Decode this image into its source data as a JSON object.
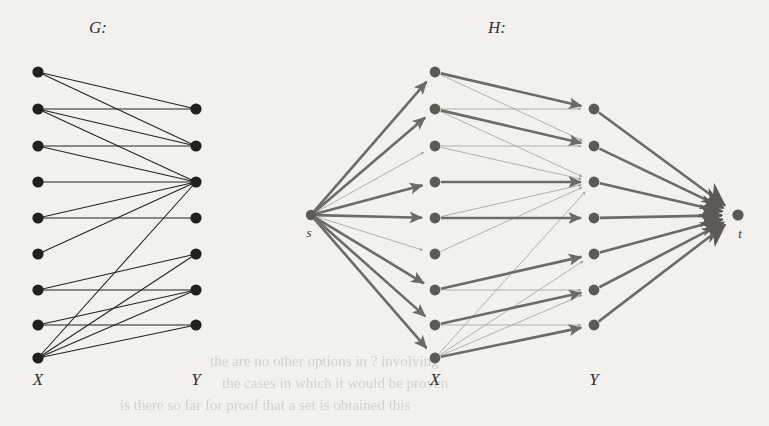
{
  "figure": {
    "background_color": "#f3f1ee",
    "ink_color": "#23211f",
    "flow_color": "#6e6b66",
    "thin_color": "#a7a39c",
    "titles": {
      "left": "G:",
      "right": "H:"
    },
    "column_labels": {
      "left_x": "X",
      "left_y": "Y",
      "right_x": "X",
      "right_y": "Y"
    },
    "terminal_labels": {
      "source": "s",
      "sink": "t"
    }
  },
  "graph_G": {
    "type": "bipartite-graph",
    "caption": "G:",
    "x_label": "X",
    "y_label": "Y",
    "x_nodes": [
      {
        "id": "x1",
        "cx": 38,
        "cy": 72
      },
      {
        "id": "x2",
        "cx": 38,
        "cy": 109
      },
      {
        "id": "x3",
        "cx": 38,
        "cy": 146
      },
      {
        "id": "x4",
        "cx": 38,
        "cy": 182
      },
      {
        "id": "x5",
        "cx": 38,
        "cy": 218
      },
      {
        "id": "x6",
        "cx": 38,
        "cy": 254
      },
      {
        "id": "x7",
        "cx": 38,
        "cy": 290
      },
      {
        "id": "x8",
        "cx": 38,
        "cy": 325
      },
      {
        "id": "x9",
        "cx": 38,
        "cy": 358
      }
    ],
    "y_nodes": [
      {
        "id": "y1",
        "cx": 196,
        "cy": 109
      },
      {
        "id": "y2",
        "cx": 196,
        "cy": 146
      },
      {
        "id": "y3",
        "cx": 196,
        "cy": 182
      },
      {
        "id": "y4",
        "cx": 196,
        "cy": 218
      },
      {
        "id": "y5",
        "cx": 196,
        "cy": 254
      },
      {
        "id": "y6",
        "cx": 196,
        "cy": 290
      },
      {
        "id": "y7",
        "cx": 196,
        "cy": 325
      }
    ],
    "edges": [
      {
        "from": "x1",
        "to": "y1"
      },
      {
        "from": "x1",
        "to": "y2"
      },
      {
        "from": "x2",
        "to": "y1"
      },
      {
        "from": "x2",
        "to": "y2"
      },
      {
        "from": "x2",
        "to": "y3"
      },
      {
        "from": "x3",
        "to": "y2"
      },
      {
        "from": "x3",
        "to": "y3"
      },
      {
        "from": "x4",
        "to": "y3"
      },
      {
        "from": "x5",
        "to": "y3"
      },
      {
        "from": "x5",
        "to": "y4"
      },
      {
        "from": "x6",
        "to": "y3"
      },
      {
        "from": "x7",
        "to": "y5"
      },
      {
        "from": "x7",
        "to": "y6"
      },
      {
        "from": "x8",
        "to": "y6"
      },
      {
        "from": "x8",
        "to": "y7"
      },
      {
        "from": "x9",
        "to": "y3"
      },
      {
        "from": "x9",
        "to": "y5"
      },
      {
        "from": "x9",
        "to": "y6"
      },
      {
        "from": "x9",
        "to": "y7"
      }
    ]
  },
  "graph_H": {
    "type": "flow-network",
    "caption": "H:",
    "x_label": "X",
    "y_label": "Y",
    "source": {
      "id": "s",
      "label": "s",
      "cx": 311,
      "cy": 215
    },
    "sink": {
      "id": "t",
      "label": "t",
      "cx": 738,
      "cy": 215
    },
    "x_nodes": [
      {
        "id": "hx1",
        "cx": 435,
        "cy": 72
      },
      {
        "id": "hx2",
        "cx": 435,
        "cy": 109
      },
      {
        "id": "hx3",
        "cx": 435,
        "cy": 146
      },
      {
        "id": "hx4",
        "cx": 435,
        "cy": 182
      },
      {
        "id": "hx5",
        "cx": 435,
        "cy": 218
      },
      {
        "id": "hx6",
        "cx": 435,
        "cy": 254
      },
      {
        "id": "hx7",
        "cx": 435,
        "cy": 290
      },
      {
        "id": "hx8",
        "cx": 435,
        "cy": 325
      },
      {
        "id": "hx9",
        "cx": 435,
        "cy": 358
      }
    ],
    "y_nodes": [
      {
        "id": "hy1",
        "cx": 594,
        "cy": 109
      },
      {
        "id": "hy2",
        "cx": 594,
        "cy": 146
      },
      {
        "id": "hy3",
        "cx": 594,
        "cy": 182
      },
      {
        "id": "hy4",
        "cx": 594,
        "cy": 218
      },
      {
        "id": "hy5",
        "cx": 594,
        "cy": 254
      },
      {
        "id": "hy6",
        "cx": 594,
        "cy": 290
      },
      {
        "id": "hy7",
        "cx": 594,
        "cy": 325
      }
    ],
    "source_edges": [
      {
        "from": "s",
        "to": "hx1",
        "weight": "thick"
      },
      {
        "from": "s",
        "to": "hx2",
        "weight": "thick"
      },
      {
        "from": "s",
        "to": "hx3",
        "weight": "thin"
      },
      {
        "from": "s",
        "to": "hx4",
        "weight": "thick"
      },
      {
        "from": "s",
        "to": "hx5",
        "weight": "thick"
      },
      {
        "from": "s",
        "to": "hx6",
        "weight": "thin"
      },
      {
        "from": "s",
        "to": "hx7",
        "weight": "thick"
      },
      {
        "from": "s",
        "to": "hx8",
        "weight": "thick"
      },
      {
        "from": "s",
        "to": "hx9",
        "weight": "thick"
      }
    ],
    "middle_edges": [
      {
        "from": "hx1",
        "to": "hy1",
        "weight": "thick"
      },
      {
        "from": "hx1",
        "to": "hy2",
        "weight": "thin"
      },
      {
        "from": "hx2",
        "to": "hy1",
        "weight": "thin"
      },
      {
        "from": "hx2",
        "to": "hy2",
        "weight": "thick"
      },
      {
        "from": "hx2",
        "to": "hy3",
        "weight": "thin"
      },
      {
        "from": "hx3",
        "to": "hy2",
        "weight": "thin"
      },
      {
        "from": "hx3",
        "to": "hy3",
        "weight": "thin"
      },
      {
        "from": "hx4",
        "to": "hy3",
        "weight": "thick"
      },
      {
        "from": "hx5",
        "to": "hy3",
        "weight": "thin"
      },
      {
        "from": "hx5",
        "to": "hy4",
        "weight": "thick"
      },
      {
        "from": "hx6",
        "to": "hy3",
        "weight": "thin"
      },
      {
        "from": "hx7",
        "to": "hy5",
        "weight": "thick"
      },
      {
        "from": "hx7",
        "to": "hy6",
        "weight": "thin"
      },
      {
        "from": "hx8",
        "to": "hy6",
        "weight": "thick"
      },
      {
        "from": "hx8",
        "to": "hy7",
        "weight": "thin"
      },
      {
        "from": "hx9",
        "to": "hy3",
        "weight": "thin"
      },
      {
        "from": "hx9",
        "to": "hy5",
        "weight": "thin"
      },
      {
        "from": "hx9",
        "to": "hy6",
        "weight": "thin"
      },
      {
        "from": "hx9",
        "to": "hy7",
        "weight": "thick"
      }
    ],
    "sink_edges": [
      {
        "from": "hy1",
        "to": "t",
        "weight": "thick"
      },
      {
        "from": "hy2",
        "to": "t",
        "weight": "thick"
      },
      {
        "from": "hy3",
        "to": "t",
        "weight": "thick"
      },
      {
        "from": "hy4",
        "to": "t",
        "weight": "thick"
      },
      {
        "from": "hy5",
        "to": "t",
        "weight": "thick"
      },
      {
        "from": "hy6",
        "to": "t",
        "weight": "thick"
      },
      {
        "from": "hy7",
        "to": "t",
        "weight": "thick"
      }
    ]
  },
  "bleed_through": {
    "note": "faint show-through text from the reverse page",
    "lines": [
      {
        "text": "the are no other options in ? involving",
        "x": 210,
        "y": 366
      },
      {
        "text": "the cases in which it would be proven",
        "x": 222,
        "y": 388
      },
      {
        "text": "is there so far for proof that a set is obtained this",
        "x": 120,
        "y": 410
      }
    ]
  }
}
